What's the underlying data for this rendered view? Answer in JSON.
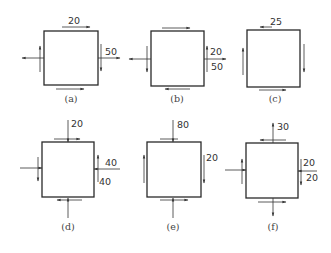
{
  "figure": {
    "stroke_color": "#2a2a2a",
    "panels": [
      {
        "id": "a",
        "caption": "(a)",
        "box": {
          "x": 44,
          "y": 31,
          "w": 54,
          "h": 54
        },
        "caption_pos": {
          "x": 71,
          "y": 102
        },
        "arrows": [
          {
            "x1": 62,
            "y1": 27,
            "x2": 90,
            "y2": 27,
            "dir": "left"
          },
          {
            "x1": 56,
            "y1": 89,
            "x2": 84,
            "y2": 89,
            "dir": "right"
          },
          {
            "x1": 44,
            "y1": 58,
            "x2": 22,
            "y2": 58,
            "dir": "to"
          },
          {
            "x1": 40,
            "y1": 72,
            "x2": 40,
            "y2": 46,
            "dir": "to"
          },
          {
            "x1": 98,
            "y1": 58,
            "x2": 120,
            "y2": 58,
            "dir": "to"
          },
          {
            "x1": 101,
            "y1": 44,
            "x2": 101,
            "y2": 71,
            "dir": "to"
          }
        ],
        "labels": [
          {
            "text": "20",
            "x": 68,
            "y": 24
          },
          {
            "text": "50",
            "x": 105,
            "y": 55
          }
        ]
      },
      {
        "id": "b",
        "caption": "(b)",
        "box": {
          "x": 151,
          "y": 31,
          "w": 53,
          "h": 55
        },
        "caption_pos": {
          "x": 177,
          "y": 102
        },
        "arrows": [
          {
            "x1": 162,
            "y1": 28,
            "x2": 190,
            "y2": 28,
            "dir": "to"
          },
          {
            "x1": 190,
            "y1": 89,
            "x2": 165,
            "y2": 89,
            "dir": "to"
          },
          {
            "x1": 151,
            "y1": 59,
            "x2": 129,
            "y2": 59,
            "dir": "to"
          },
          {
            "x1": 147,
            "y1": 46,
            "x2": 147,
            "y2": 72,
            "dir": "to"
          },
          {
            "x1": 204,
            "y1": 59,
            "x2": 226,
            "y2": 59,
            "dir": "to"
          },
          {
            "x1": 207,
            "y1": 72,
            "x2": 207,
            "y2": 46,
            "dir": "to"
          }
        ],
        "labels": [
          {
            "text": "20",
            "x": 210,
            "y": 55
          },
          {
            "text": "50",
            "x": 211,
            "y": 70
          }
        ]
      },
      {
        "id": "c",
        "caption": "(c)",
        "box": {
          "x": 247,
          "y": 30,
          "w": 53,
          "h": 57
        },
        "caption_pos": {
          "x": 275,
          "y": 102
        },
        "arrows": [
          {
            "x1": 272,
            "y1": 27,
            "x2": 260,
            "y2": 27,
            "dir": "to"
          },
          {
            "x1": 259,
            "y1": 90,
            "x2": 286,
            "y2": 90,
            "dir": "to"
          },
          {
            "x1": 243,
            "y1": 75,
            "x2": 243,
            "y2": 48,
            "dir": "to"
          },
          {
            "x1": 304,
            "y1": 44,
            "x2": 304,
            "y2": 72,
            "dir": "to"
          }
        ],
        "labels": [
          {
            "text": "25",
            "x": 270,
            "y": 25
          }
        ]
      },
      {
        "id": "d",
        "caption": "(d)",
        "box": {
          "x": 42,
          "y": 142,
          "w": 52,
          "h": 55
        },
        "caption_pos": {
          "x": 68,
          "y": 230
        },
        "arrows": [
          {
            "x1": 54,
            "y1": 139,
            "x2": 80,
            "y2": 139,
            "dir": "to"
          },
          {
            "x1": 68,
            "y1": 120,
            "x2": 68,
            "y2": 142,
            "dir": "to"
          },
          {
            "x1": 82,
            "y1": 200,
            "x2": 57,
            "y2": 200,
            "dir": "to"
          },
          {
            "x1": 68,
            "y1": 218,
            "x2": 68,
            "y2": 198,
            "dir": "to"
          },
          {
            "x1": 20,
            "y1": 168,
            "x2": 42,
            "y2": 168,
            "dir": "to"
          },
          {
            "x1": 38,
            "y1": 157,
            "x2": 38,
            "y2": 181,
            "dir": "to"
          },
          {
            "x1": 120,
            "y1": 169,
            "x2": 94,
            "y2": 169,
            "dir": "to"
          },
          {
            "x1": 98,
            "y1": 182,
            "x2": 98,
            "y2": 155,
            "dir": "to"
          }
        ],
        "labels": [
          {
            "text": "20",
            "x": 71,
            "y": 127
          },
          {
            "text": "40",
            "x": 105,
            "y": 166
          },
          {
            "text": "40",
            "x": 99,
            "y": 185
          }
        ]
      },
      {
        "id": "e",
        "caption": "(e)",
        "box": {
          "x": 147,
          "y": 142,
          "w": 54,
          "h": 55
        },
        "caption_pos": {
          "x": 173,
          "y": 230
        },
        "arrows": [
          {
            "x1": 160,
            "y1": 139,
            "x2": 178,
            "y2": 139,
            "dir": "none"
          },
          {
            "x1": 173,
            "y1": 120,
            "x2": 173,
            "y2": 142,
            "dir": "to"
          },
          {
            "x1": 160,
            "y1": 200,
            "x2": 188,
            "y2": 200,
            "dir": "to"
          },
          {
            "x1": 173,
            "y1": 218,
            "x2": 173,
            "y2": 198,
            "dir": "to"
          },
          {
            "x1": 144,
            "y1": 183,
            "x2": 144,
            "y2": 155,
            "dir": "to"
          },
          {
            "x1": 204,
            "y1": 155,
            "x2": 204,
            "y2": 183,
            "dir": "to"
          }
        ],
        "labels": [
          {
            "text": "80",
            "x": 177,
            "y": 128
          },
          {
            "text": "20",
            "x": 206,
            "y": 161
          }
        ]
      },
      {
        "id": "f",
        "caption": "(f)",
        "box": {
          "x": 246,
          "y": 143,
          "w": 52,
          "h": 55
        },
        "caption_pos": {
          "x": 273,
          "y": 230
        },
        "arrows": [
          {
            "x1": 286,
            "y1": 140,
            "x2": 260,
            "y2": 140,
            "dir": "to"
          },
          {
            "x1": 273,
            "y1": 143,
            "x2": 273,
            "y2": 123,
            "dir": "to"
          },
          {
            "x1": 258,
            "y1": 202,
            "x2": 286,
            "y2": 202,
            "dir": "to"
          },
          {
            "x1": 273,
            "y1": 198,
            "x2": 273,
            "y2": 216,
            "dir": "to"
          },
          {
            "x1": 225,
            "y1": 170,
            "x2": 246,
            "y2": 170,
            "dir": "to"
          },
          {
            "x1": 242,
            "y1": 184,
            "x2": 242,
            "y2": 159,
            "dir": "to"
          },
          {
            "x1": 317,
            "y1": 171,
            "x2": 298,
            "y2": 171,
            "dir": "to"
          },
          {
            "x1": 301,
            "y1": 159,
            "x2": 301,
            "y2": 185,
            "dir": "to"
          }
        ],
        "labels": [
          {
            "text": "30",
            "x": 277,
            "y": 130
          },
          {
            "text": "20",
            "x": 303,
            "y": 166
          },
          {
            "text": "20",
            "x": 306,
            "y": 181
          }
        ]
      }
    ]
  }
}
